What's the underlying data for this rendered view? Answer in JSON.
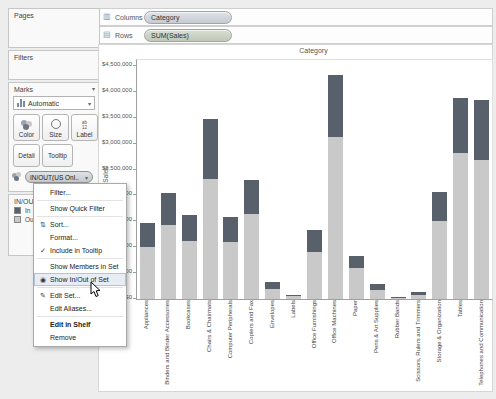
{
  "shelves": {
    "columns": {
      "label": "Columns",
      "icon": "▥",
      "pill": "Category"
    },
    "rows": {
      "label": "Rows",
      "icon": "▤",
      "pill": "SUM(Sales)"
    }
  },
  "sidebar": {
    "pages": {
      "title": "Pages"
    },
    "filters": {
      "title": "Filters"
    },
    "marks": {
      "title": "Marks",
      "header_caret": "▾",
      "type_selector": "Automatic",
      "type_caret": "▾",
      "buttons": {
        "color": "Color",
        "size": "Size",
        "label": "Label",
        "detail": "Detail",
        "tooltip": "Tooltip"
      },
      "field_pill": "IN/OUT(US Onl..",
      "pill_caret": "▾"
    },
    "legend": {
      "title": "IN/OUT(US Onl...",
      "items": [
        {
          "label": "In",
          "color": "#57606b"
        },
        {
          "label": "Out",
          "color": "#c9c9c9"
        }
      ]
    }
  },
  "context_menu": {
    "items": [
      {
        "label": "Filter...",
        "sep_after": true
      },
      {
        "label": "Show Quick Filter",
        "sep_after": true
      },
      {
        "label": "Sort...",
        "icon": "sort"
      },
      {
        "label": "Format..."
      },
      {
        "label": "Include in Tooltip",
        "icon": "check",
        "sep_after": true
      },
      {
        "label": "Show Members in Set"
      },
      {
        "label": "Show In/Out of Set",
        "icon": "inout",
        "highlighted": true,
        "sep_after": true
      },
      {
        "label": "Edit Set...",
        "icon": "edit"
      },
      {
        "label": "Edit Aliases...",
        "sep_after": true
      },
      {
        "label": "Edit in Shelf",
        "bold": true
      },
      {
        "label": "Remove"
      }
    ],
    "icon_glyphs": {
      "sort": "⇅",
      "check": "✓",
      "inout": "◉",
      "edit": "✎"
    }
  },
  "chart_data": {
    "type": "bar",
    "stacked": true,
    "title": "Category",
    "ylabel": "Sales",
    "ylim": [
      0,
      4500000
    ],
    "ytick_interval": 500000,
    "ytick_labels": [
      "$0",
      "$500,000",
      "$1,000,000",
      "$1,500,000",
      "$2,000,000",
      "$2,500,000",
      "$3,000,000",
      "$3,500,000",
      "$4,000,000",
      "$4,500,000"
    ],
    "grid": false,
    "legend_position": "left-card",
    "categories": [
      "Appliances",
      "Binders and Binder Accessories",
      "Bookcases",
      "Chairs & Chairmats",
      "Computer Peripherals",
      "Copiers and Fax",
      "Envelopes",
      "Labels",
      "Office Furnishings",
      "Office Machines",
      "Paper",
      "Pens & Art Supplies",
      "Rubber Bands",
      "Scissors, Rulers and Trimmers",
      "Storage & Organization",
      "Tables",
      "Telephones and Communication"
    ],
    "series": [
      {
        "name": "Out",
        "color": "#c9c9c9",
        "values": [
          1000000,
          1430000,
          1120000,
          2310000,
          1100000,
          1640000,
          190000,
          50000,
          910000,
          3130000,
          600000,
          170000,
          30000,
          80000,
          1510000,
          2820000,
          2680000
        ]
      },
      {
        "name": "In",
        "color": "#57606b",
        "values": [
          470000,
          620000,
          500000,
          1160000,
          480000,
          660000,
          140000,
          30000,
          430000,
          1190000,
          230000,
          120000,
          10000,
          60000,
          560000,
          1060000,
          1160000
        ]
      }
    ]
  }
}
